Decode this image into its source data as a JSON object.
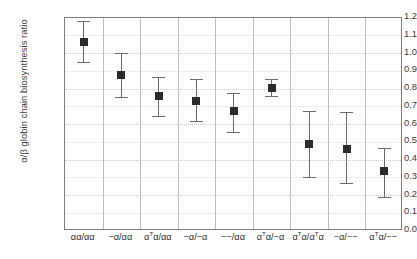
{
  "chart_data": {
    "type": "scatter",
    "title": "",
    "xlabel": "",
    "ylabel": "α/β globin chain biosynthesis ratio",
    "ylim": [
      0.0,
      1.2
    ],
    "ytick_labels": [
      "1.2",
      "1.1",
      "1.0",
      "0.9",
      "0.8",
      "0.7",
      "0.6",
      "0.5",
      "0.4",
      "0.3",
      "0.2",
      "0.1",
      "0.0"
    ],
    "ytick_values": [
      1.2,
      1.1,
      1.0,
      0.9,
      0.8,
      0.7,
      0.6,
      0.5,
      0.4,
      0.3,
      0.2,
      0.1,
      0.0
    ],
    "grid": true,
    "legend": "none",
    "marker_color": "#2b2b2b",
    "errorbar_color": "#6a6a6a",
    "frame_color": "#7d7d7d",
    "categories": [
      "αα/αα",
      "−α/αα",
      "αᵀα/αα",
      "−α/−α",
      "−−/αα",
      "αᵀα/−α",
      "αᵀα/αᵀα",
      "−α/−−",
      "αᵀα/−−"
    ],
    "categories_markup": [
      "αα/αα",
      "−α/αα",
      "α<sup>T</sup>α/αα",
      "−α/−α",
      "−−/αα",
      "α<sup>T</sup>α/−α",
      "α<sup>T</sup>α/α<sup>T</sup>α",
      "−α/−−",
      "α<sup>T</sup>α/−−"
    ],
    "values": [
      1.06,
      0.875,
      0.755,
      0.73,
      0.675,
      0.805,
      0.485,
      0.46,
      0.335
    ],
    "error_low": [
      0.95,
      0.75,
      0.645,
      0.615,
      0.555,
      0.755,
      0.3,
      0.265,
      0.19
    ],
    "error_high": [
      1.18,
      1.0,
      0.865,
      0.855,
      0.775,
      0.855,
      0.675,
      0.665,
      0.465
    ]
  }
}
